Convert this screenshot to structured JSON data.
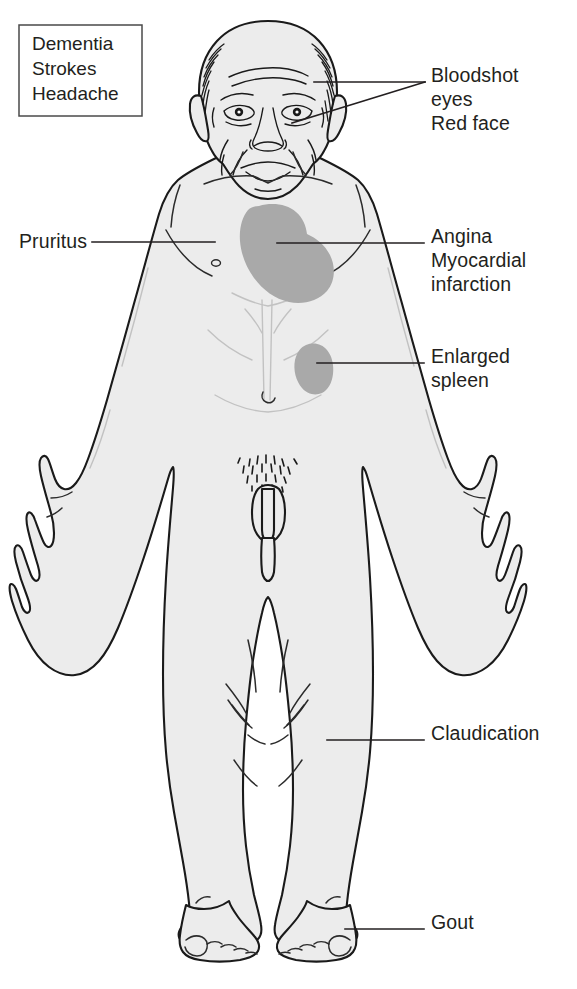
{
  "figure": {
    "colors": {
      "body_fill": "#ececec",
      "outline": "#1a1a1a",
      "organ_shade": "#a9a9a9",
      "text": "#231f20",
      "box_border": "#4a4a4a",
      "background": "#ffffff"
    }
  },
  "text_box": {
    "name": "neurologic-symptoms-box",
    "lines": [
      "Dementia",
      "Strokes",
      "Headache"
    ]
  },
  "labels": [
    {
      "id": "bloodshot-eyes",
      "lines": [
        "Bloodshot",
        "eyes",
        "Red face"
      ],
      "side": "right",
      "target": "eye and cheek"
    },
    {
      "id": "pruritus",
      "lines": [
        "Pruritus"
      ],
      "side": "left",
      "target": "skin of chest"
    },
    {
      "id": "angina",
      "lines": [
        "Angina",
        "Myocardial",
        "infarction"
      ],
      "side": "right",
      "target": "heart"
    },
    {
      "id": "enlarged-spleen",
      "lines": [
        "Enlarged",
        "spleen"
      ],
      "side": "right",
      "target": "spleen"
    },
    {
      "id": "claudication",
      "lines": [
        "Claudication"
      ],
      "side": "right",
      "target": "lower leg"
    },
    {
      "id": "gout",
      "lines": [
        "Gout"
      ],
      "side": "right",
      "target": "great toe"
    }
  ],
  "organs": [
    {
      "id": "heart",
      "label": "heart",
      "shade": "#a9a9a9"
    },
    {
      "id": "spleen",
      "label": "spleen",
      "shade": "#a9a9a9"
    }
  ]
}
